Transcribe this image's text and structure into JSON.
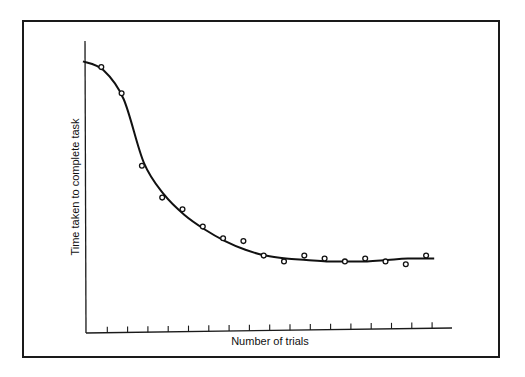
{
  "chart_data": {
    "type": "line",
    "title": "",
    "xlabel": "Number of trials",
    "ylabel": "Time taken to complete task",
    "x_ticks_count": 17,
    "tick_labels_shown": false,
    "grid": false,
    "legend": null,
    "xlim": [
      0,
      18
    ],
    "ylim": [
      0,
      100
    ],
    "series": [
      {
        "name": "observed trials",
        "marker": "open-circle",
        "x": [
          1,
          2,
          3,
          4,
          5,
          6,
          7,
          8,
          9,
          10,
          11,
          12,
          13,
          14,
          15,
          16,
          17
        ],
        "values": [
          91,
          82,
          57,
          46,
          42,
          36,
          32,
          31,
          26,
          24,
          26,
          25,
          24,
          25,
          24,
          23,
          26
        ]
      },
      {
        "name": "fitted learning curve",
        "marker": "none",
        "style": "smooth-line",
        "x": [
          0,
          1,
          2,
          3,
          4,
          5,
          6,
          7,
          8,
          9,
          10,
          11,
          12,
          13,
          14,
          15,
          16,
          17.3
        ],
        "values": [
          93,
          90,
          80,
          58,
          47,
          40,
          35,
          31,
          28,
          26,
          25,
          24.5,
          24,
          24,
          24,
          24.5,
          25,
          25
        ]
      }
    ]
  },
  "labels": {
    "x_axis": "Number of trials",
    "y_axis": "Time taken to complete task"
  }
}
